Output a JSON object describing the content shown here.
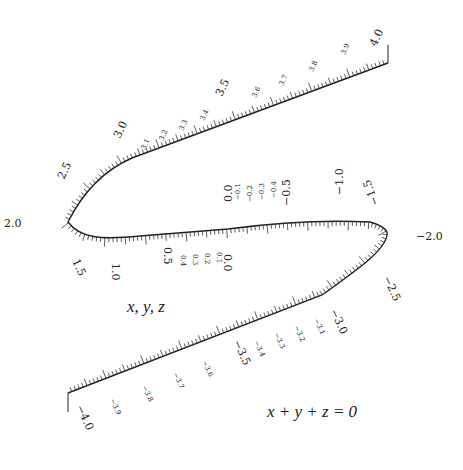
{
  "diagram": {
    "type": "nomogram",
    "scale_label": "x, y, z",
    "equation": "x + y + z = 0",
    "major_ticks": [
      {
        "label": "4.0",
        "x": 388,
        "y": 63,
        "angle": -65,
        "dx": -12,
        "dy": -16
      },
      {
        "label": "3.5",
        "x": 232,
        "y": 113,
        "angle": -65,
        "dx": -10,
        "dy": -16
      },
      {
        "label": "3.0",
        "x": 132,
        "y": 155,
        "angle": -65,
        "dx": -12,
        "dy": -16
      },
      {
        "label": "2.5",
        "x": 74,
        "y": 190,
        "angle": -65,
        "dx": -10,
        "dy": -10
      },
      {
        "label": "2.0",
        "x": 40,
        "y": 222,
        "angle": 0,
        "dx": -36,
        "dy": 5
      },
      {
        "label": "1.5",
        "x": 78,
        "y": 243,
        "angle": 65,
        "dx": -6,
        "dy": 18
      },
      {
        "label": "1.0",
        "x": 116,
        "y": 237,
        "angle": 90,
        "dx": -4,
        "dy": 26
      },
      {
        "label": "0.5",
        "x": 168,
        "y": 233,
        "angle": 90,
        "dx": -4,
        "dy": 14
      },
      {
        "label": "0.0",
        "x": 228,
        "y": 230,
        "angle": 90,
        "dx": -4,
        "dy": 24
      },
      {
        "label": "0.0",
        "x": 228,
        "y": 228,
        "angle": -90,
        "dx": 4,
        "dy": -26
      },
      {
        "label": "−0.5",
        "x": 286,
        "y": 222,
        "angle": -90,
        "dx": 4,
        "dy": -16
      },
      {
        "label": "−1.0",
        "x": 339,
        "y": 221,
        "angle": -90,
        "dx": 4,
        "dy": -26
      },
      {
        "label": "−1.5",
        "x": 377,
        "y": 220,
        "angle": -110,
        "dx": 2,
        "dy": -16
      },
      {
        "label": "−2.0",
        "x": 410,
        "y": 235,
        "angle": 0,
        "dx": 6,
        "dy": 5
      },
      {
        "label": "−2.5",
        "x": 375,
        "y": 268,
        "angle": 65,
        "dx": 8,
        "dy": 10
      },
      {
        "label": "−3.0",
        "x": 322,
        "y": 297,
        "angle": 65,
        "dx": 8,
        "dy": 14
      },
      {
        "label": "−3.5",
        "x": 225,
        "y": 330,
        "angle": 65,
        "dx": 8,
        "dy": 12
      },
      {
        "label": "−4.0",
        "x": 68,
        "y": 393,
        "angle": 65,
        "dx": 8,
        "dy": 14
      }
    ],
    "minor_labels": [
      {
        "label": "3.9",
        "x": 345,
        "y": 55,
        "angle": -65
      },
      {
        "label": "3.8",
        "x": 313,
        "y": 72,
        "angle": -65
      },
      {
        "label": "3.7",
        "x": 283,
        "y": 86,
        "angle": -65
      },
      {
        "label": "3.6",
        "x": 256,
        "y": 98,
        "angle": -65
      },
      {
        "label": "3.4",
        "x": 204,
        "y": 121,
        "angle": -65
      },
      {
        "label": "3.3",
        "x": 183,
        "y": 131,
        "angle": -65
      },
      {
        "label": "3.2",
        "x": 163,
        "y": 141,
        "angle": -65
      },
      {
        "label": "3.1",
        "x": 145,
        "y": 150,
        "angle": -65
      },
      {
        "label": "0.4",
        "x": 181,
        "y": 255,
        "angle": 90
      },
      {
        "label": "0.3",
        "x": 193,
        "y": 254,
        "angle": 90
      },
      {
        "label": "0.2",
        "x": 205,
        "y": 253,
        "angle": 90
      },
      {
        "label": "0.1",
        "x": 217,
        "y": 252,
        "angle": 90
      },
      {
        "label": "−0.1",
        "x": 240,
        "y": 200,
        "angle": -90
      },
      {
        "label": "−0.2",
        "x": 252,
        "y": 202,
        "angle": -90
      },
      {
        "label": "−0.3",
        "x": 264,
        "y": 200,
        "angle": -90
      },
      {
        "label": "−0.4",
        "x": 276,
        "y": 198,
        "angle": -90
      },
      {
        "label": "−3.1",
        "x": 314,
        "y": 320,
        "angle": 65
      },
      {
        "label": "−3.2",
        "x": 294,
        "y": 327,
        "angle": 65
      },
      {
        "label": "−3.3",
        "x": 274,
        "y": 334,
        "angle": 65
      },
      {
        "label": "−3.4",
        "x": 254,
        "y": 342,
        "angle": 65
      },
      {
        "label": "−3.6",
        "x": 202,
        "y": 362,
        "angle": 65
      },
      {
        "label": "−3.7",
        "x": 173,
        "y": 374,
        "angle": 65
      },
      {
        "label": "−3.8",
        "x": 142,
        "y": 387,
        "angle": 65
      },
      {
        "label": "−3.9",
        "x": 110,
        "y": 400,
        "angle": 65
      }
    ]
  }
}
